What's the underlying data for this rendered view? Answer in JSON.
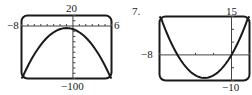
{
  "problem_numbers": {
    "left": "6.",
    "right": "7."
  },
  "chart_data": [
    {
      "type": "line",
      "problem": "6",
      "title": "",
      "xlabel": "",
      "ylabel": "",
      "xlim": [
        -8,
        6
      ],
      "ylim": [
        -100,
        20
      ],
      "x_tick_spacing": 1,
      "y_tick_spacing": 10,
      "window_labels": {
        "xmin": "−8",
        "xmax": "6",
        "ymax": "20",
        "ymin": "−100"
      },
      "grid": false,
      "series": [
        {
          "name": "downward parabola",
          "equation": "y = -2(x+1)^2 - 4",
          "x": [
            -8,
            -7,
            -6,
            -5,
            -4,
            -3,
            -2,
            -1,
            0,
            1,
            2,
            3,
            4,
            5,
            6
          ],
          "y": [
            -102,
            -76,
            -54,
            -36,
            -22,
            -12,
            -6,
            -4,
            -6,
            -12,
            -22,
            -36,
            -54,
            -76,
            -102
          ]
        }
      ]
    },
    {
      "type": "line",
      "problem": "7",
      "title": "",
      "xlabel": "",
      "ylabel": "",
      "xlim": [
        -8,
        2
      ],
      "ylim": [
        -10,
        15
      ],
      "x_tick_spacing": 2,
      "y_tick_spacing": 5,
      "window_labels": {
        "xmin": "−8",
        "ymax": "15",
        "ymin": "−10"
      },
      "grid": false,
      "series": [
        {
          "name": "upward parabola",
          "equation": "y = x^2 + 6x",
          "x": [
            -8,
            -7,
            -6,
            -5,
            -4,
            -3,
            -2,
            -1,
            0,
            1,
            2
          ],
          "y": [
            16,
            7,
            0,
            -5,
            -8,
            -9,
            -8,
            -5,
            0,
            7,
            16
          ]
        }
      ]
    }
  ]
}
